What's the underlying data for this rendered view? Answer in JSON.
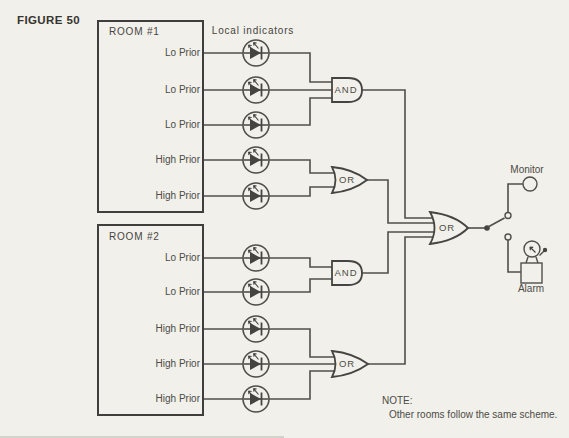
{
  "figure_label": "FIGURE 50",
  "indicators_label": "Local indicators",
  "rooms": [
    {
      "title": "ROOM #1",
      "signals": [
        "Lo Prior",
        "Lo Prior",
        "Lo Prior",
        "High Prior",
        "High Prior"
      ],
      "gates": {
        "lo_priority": {
          "type": "AND",
          "label": "AND"
        },
        "high_priority": {
          "type": "OR",
          "label": "OR"
        }
      }
    },
    {
      "title": "ROOM #2",
      "signals": [
        "Lo Prior",
        "Lo Prior",
        "High Prior",
        "High Prior",
        "High Prior"
      ],
      "gates": {
        "lo_priority": {
          "type": "AND",
          "label": "AND"
        },
        "high_priority": {
          "type": "OR",
          "label": "OR"
        }
      }
    }
  ],
  "master_gate": {
    "type": "OR",
    "label": "OR"
  },
  "outputs": {
    "monitor_label": "Monitor",
    "alarm_label": "Alarm"
  },
  "note": {
    "heading": "NOTE:",
    "body": "Other rooms follow the same scheme."
  },
  "colors": {
    "background": "#f2f0ea",
    "line": "#504f4a",
    "text": "#454440"
  }
}
